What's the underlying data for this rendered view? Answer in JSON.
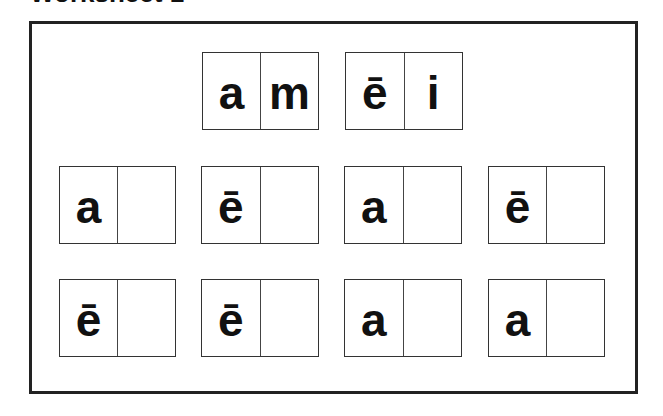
{
  "title": "Worksheet 1",
  "example_tiles": [
    {
      "left": "a",
      "right": "m"
    },
    {
      "left": "ē",
      "right": "i"
    }
  ],
  "exercise_rows": [
    [
      {
        "left": "a",
        "right": ""
      },
      {
        "left": "ē",
        "right": ""
      },
      {
        "left": "a",
        "right": ""
      },
      {
        "left": "ē",
        "right": ""
      }
    ],
    [
      {
        "left": "ē",
        "right": ""
      },
      {
        "left": "ē",
        "right": ""
      },
      {
        "left": "a",
        "right": ""
      },
      {
        "left": "a",
        "right": ""
      }
    ]
  ]
}
